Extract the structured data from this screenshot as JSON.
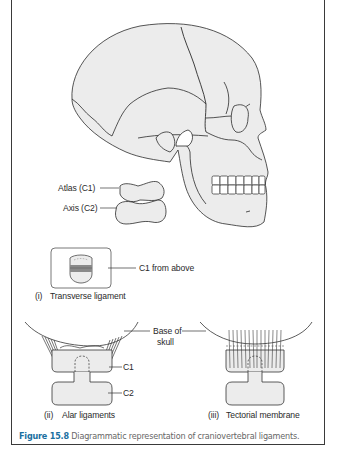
{
  "figure": {
    "number_label": "Figure 15.8",
    "caption_text": "Diagrammatic representation of craniovertebral ligaments.",
    "accent_color": "#1a6fa0"
  },
  "skull": {
    "labels": {
      "atlas": "Atlas (C1)",
      "axis": "Axis (C2)"
    }
  },
  "panel_i": {
    "index": "(i)",
    "title": "Transverse ligament",
    "callout": "C1 from above"
  },
  "panel_ii": {
    "index": "(ii)",
    "title": "Alar ligaments",
    "callouts": {
      "base_line1": "Base of",
      "base_line2": "skull",
      "c1": "C1",
      "c2": "C2"
    }
  },
  "panel_iii": {
    "index": "(iii)",
    "title": "Tectorial membrane"
  },
  "colors": {
    "fill": "#ececec",
    "stroke": "#2b2b2b",
    "ligament_band": "#8a8a8a"
  }
}
